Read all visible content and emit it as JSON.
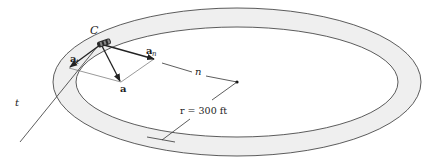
{
  "diagram": {
    "type": "circular track with car acceleration vectors",
    "labels": {
      "car": "C",
      "tangent_axis": "t",
      "normal_axis": "n",
      "accel_total": "a",
      "accel_tangential_base": "a",
      "accel_tangential_sub": "t",
      "accel_normal_base": "a",
      "accel_normal_sub": "n",
      "radius": "r = 300 ft"
    },
    "colors": {
      "track_fill": "#efefef",
      "line": "#333333",
      "vector": "#222222",
      "car": "#2a2a2a"
    }
  }
}
